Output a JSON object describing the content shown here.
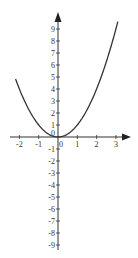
{
  "chart_data": {
    "type": "line",
    "title": "",
    "xlabel": "",
    "ylabel": "",
    "function": "y = x^2",
    "series": [
      {
        "name": "y = x^2",
        "x": [
          -2.2,
          -2,
          -1.5,
          -1,
          -0.5,
          0,
          0.5,
          1,
          1.5,
          2,
          2.5,
          3,
          3.1
        ],
        "values": [
          4.84,
          4,
          2.25,
          1,
          0.25,
          0,
          0.25,
          1,
          2.25,
          4,
          6.25,
          9,
          9.61
        ]
      }
    ],
    "x_ticks": [
      "-2",
      "-1",
      "0",
      "1",
      "2",
      "3"
    ],
    "y_ticks": [
      "9",
      "8",
      "7",
      "6",
      "5",
      "4",
      "3",
      "2",
      "1",
      "0",
      "-1",
      "-2",
      "-3",
      "-4",
      "-5",
      "-6",
      "-7",
      "-8",
      "-9"
    ],
    "xlim": [
      -2.3,
      3.4
    ],
    "ylim": [
      -9.5,
      10
    ],
    "grid": false,
    "legend": "none"
  }
}
